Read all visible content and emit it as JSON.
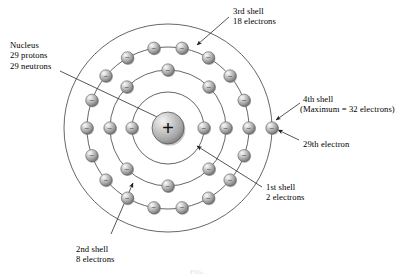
{
  "figure": {
    "title_alt": "Bohr model of the copper atom",
    "caption": "FIG."
  },
  "labels": {
    "nucleus": {
      "line1": "Nucleus",
      "line2": "29 protons",
      "line3": "29 neutrons"
    },
    "shell3": {
      "line1": "3rd shell",
      "line2": "18 electrons"
    },
    "shell4": {
      "line1": "4th shell",
      "line2": "(Maximum = 32 electrons)"
    },
    "valence": {
      "line1": "29th electron"
    },
    "shell1": {
      "line1": "1st shell",
      "line2": "2 electrons"
    },
    "shell2": {
      "line1": "2nd shell",
      "line2": "8 electrons"
    }
  },
  "nucleus": {
    "charge_symbol": "+",
    "cx": 168,
    "cy": 128,
    "r": 16
  },
  "electron": {
    "charge_symbol": "−",
    "r": 6.2
  },
  "colors": {
    "sphere_light": "#f0f0f0",
    "sphere_mid": "#b8b8b8",
    "sphere_dark": "#6e6e6e",
    "orbit_stroke": "#4a4a4a",
    "leader_stroke": "#2b2b2b",
    "text": "#000000",
    "background": "#ffffff"
  },
  "chart_data": {
    "type": "scatter",
    "center": {
      "x": 168,
      "y": 128
    },
    "shells": [
      {
        "name": "1st shell",
        "index": 1,
        "radius": 36,
        "electron_count": 2,
        "max_electrons": 2,
        "angles_deg": [
          180,
          0
        ]
      },
      {
        "name": "2nd shell",
        "index": 2,
        "radius": 58,
        "electron_count": 8,
        "max_electrons": 8,
        "angles_deg": [
          180,
          135,
          90,
          45,
          0,
          315,
          270,
          225
        ]
      },
      {
        "name": "3rd shell",
        "index": 3,
        "radius": 81,
        "electron_count": 18,
        "max_electrons": 18,
        "angles_deg": [
          180,
          160,
          140,
          120,
          100,
          80,
          60,
          40,
          20,
          0,
          340,
          320,
          300,
          280,
          260,
          240,
          220,
          200
        ]
      },
      {
        "name": "4th shell",
        "index": 4,
        "radius": 104,
        "electron_count": 1,
        "max_electrons": 32,
        "angles_deg": [
          0
        ]
      }
    ],
    "protons": 29,
    "neutrons": 29,
    "total_electrons": 29
  }
}
